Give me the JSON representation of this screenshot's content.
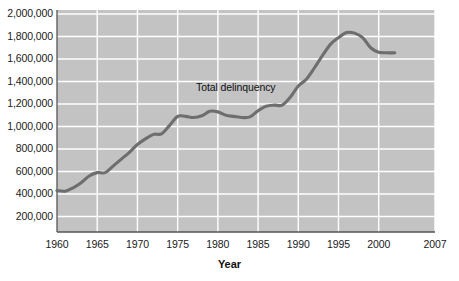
{
  "chart_data": {
    "type": "line",
    "title": "",
    "subtitle": "",
    "xlabel": "Year",
    "ylabel": "",
    "xlim": [
      1960,
      2007
    ],
    "ylim": [
      0,
      2000000
    ],
    "grid": true,
    "legend_position": "none",
    "annotations": [
      {
        "text": "Total delinquency",
        "x": 1981,
        "y": 1290000
      }
    ],
    "xticks": [
      1960,
      1965,
      1970,
      1975,
      1980,
      1985,
      1990,
      1995,
      2000,
      2007
    ],
    "xtick_labels": [
      "1960",
      "1965",
      "1970",
      "1975",
      "1980",
      "1985",
      "1990",
      "1995",
      "2000",
      "2007"
    ],
    "yticks": [
      200000,
      400000,
      600000,
      800000,
      1000000,
      1200000,
      1400000,
      1600000,
      1800000,
      2000000
    ],
    "ytick_labels": [
      "200,000",
      "400,000",
      "600,000",
      "800,000",
      "1,000,000",
      "1,200,000",
      "1,400,000",
      "1,600,000",
      "1,800,000",
      "2,000,000"
    ],
    "series": [
      {
        "name": "Total delinquency",
        "color": "#6e6e6e",
        "x": [
          1960,
          1961,
          1962,
          1963,
          1964,
          1965,
          1966,
          1967,
          1968,
          1969,
          1970,
          1971,
          1972,
          1973,
          1974,
          1975,
          1976,
          1977,
          1978,
          1979,
          1980,
          1981,
          1982,
          1983,
          1984,
          1985,
          1986,
          1987,
          1988,
          1989,
          1990,
          1991,
          1992,
          1993,
          1994,
          1995,
          1996,
          1997,
          1998,
          1999,
          2000,
          2001,
          2002
        ],
        "values": [
          430000,
          425000,
          455000,
          500000,
          560000,
          590000,
          590000,
          650000,
          710000,
          770000,
          840000,
          890000,
          930000,
          935000,
          1010000,
          1090000,
          1090000,
          1080000,
          1095000,
          1135000,
          1130000,
          1100000,
          1090000,
          1080000,
          1085000,
          1140000,
          1180000,
          1190000,
          1190000,
          1260000,
          1360000,
          1420000,
          1520000,
          1630000,
          1730000,
          1790000,
          1835000,
          1830000,
          1790000,
          1700000,
          1660000,
          1655000,
          1655000
        ]
      }
    ]
  },
  "axes": {
    "plot_background_color": "#c3c3c3",
    "gridline_color": "#ffffff",
    "axis_line_color": "#555555"
  }
}
